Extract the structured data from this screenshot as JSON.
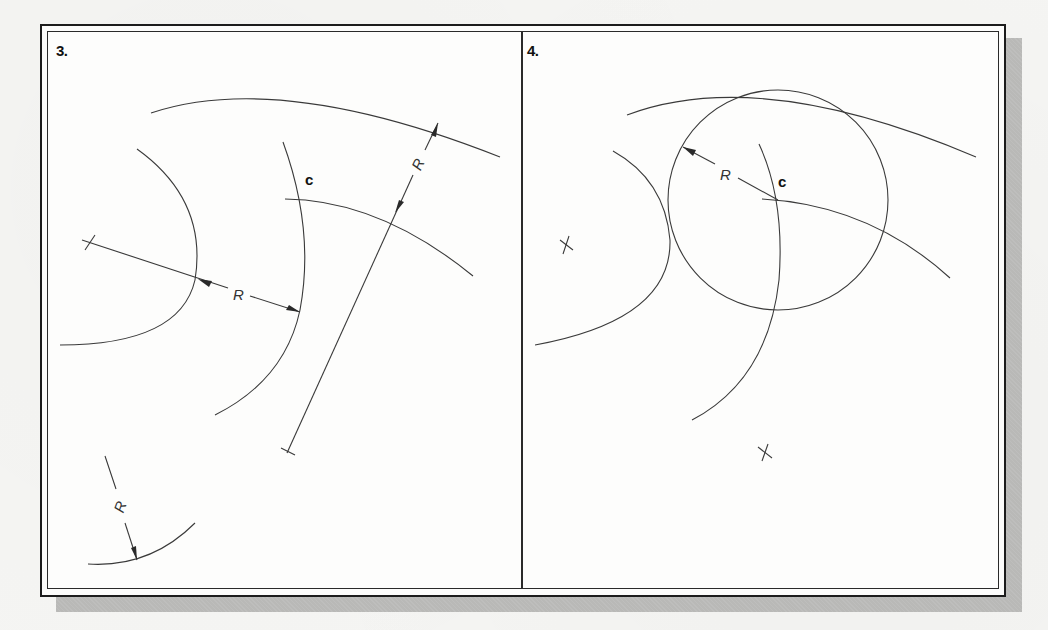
{
  "figure": {
    "panels": [
      {
        "label": "3.",
        "point_label": "c",
        "dimension_labels": [
          "R",
          "R",
          "R"
        ]
      },
      {
        "label": "4.",
        "point_label": "c",
        "dimension_labels": [
          "R"
        ]
      }
    ]
  },
  "colors": {
    "line": "#3a3a3a",
    "frame": "#1c1c1c",
    "shadow": "#b9b9b7",
    "paper": "#fdfdfc"
  }
}
